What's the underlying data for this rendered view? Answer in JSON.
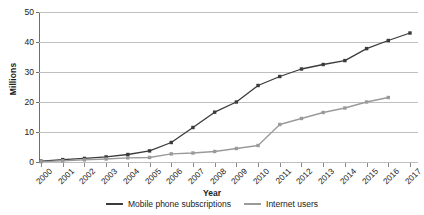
{
  "chart_data": {
    "type": "line",
    "title": "",
    "xlabel": "Year",
    "ylabel": "Millions",
    "ylim": [
      0,
      50
    ],
    "yticks": [
      0,
      10,
      20,
      30,
      40,
      50
    ],
    "grid": true,
    "legend_position": "bottom-center",
    "categories": [
      "2000",
      "2001",
      "2002",
      "2003",
      "2004",
      "2005",
      "2006",
      "2007",
      "2008",
      "2009",
      "2010",
      "2011",
      "2012",
      "2013",
      "2014",
      "2015",
      "2016",
      "2017"
    ],
    "series": [
      {
        "name": "Mobile phone subscriptions",
        "color": "#3b3b3b",
        "marker": "square",
        "values": [
          0.3,
          0.8,
          1.2,
          1.7,
          2.5,
          3.7,
          6.5,
          11.5,
          16.6,
          20.0,
          25.5,
          28.5,
          31.0,
          32.5,
          33.8,
          37.8,
          40.5,
          43.0
        ]
      },
      {
        "name": "Internet users",
        "color": "#9a9a9a",
        "marker": "square",
        "values": [
          0.1,
          0.4,
          0.7,
          1.0,
          1.4,
          1.5,
          2.7,
          3.0,
          3.5,
          4.5,
          5.5,
          12.5,
          14.5,
          16.5,
          18.0,
          20.0,
          21.5,
          null
        ]
      }
    ]
  },
  "axis": {
    "y_title": "Millions",
    "x_title": "Year"
  },
  "colors": {
    "mobile": "#3b3b3b",
    "internet": "#9a9a9a",
    "grid": "#bfbfbf",
    "axis": "#6e6e6e",
    "background": "#ffffff"
  },
  "legend": {
    "items": [
      {
        "label": "Mobile phone subscriptions",
        "color": "#3b3b3b"
      },
      {
        "label": "Internet users",
        "color": "#9a9a9a"
      }
    ]
  }
}
